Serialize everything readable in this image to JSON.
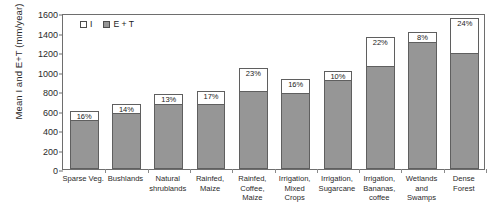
{
  "chart_data": {
    "type": "bar",
    "subtype": "stacked-bar",
    "title": "",
    "xlabel": "",
    "ylabel": "Mean I and E+T (mm/year)",
    "ylim": [
      0,
      1600
    ],
    "ytick_step": 200,
    "yticks": [
      0,
      200,
      400,
      600,
      800,
      1000,
      1200,
      1400,
      1600
    ],
    "ytick_labels": [
      "0",
      "200",
      "400",
      "600",
      "800",
      "1000",
      "1200",
      "1400",
      "1600"
    ],
    "grid": false,
    "legend_position": "top-left-inside",
    "categories": [
      "Sparse Veg.",
      "Bushlands",
      "Natural shrublands",
      "Rainfed, Maize",
      "Rainfed, Coffee, Maize",
      "Irrigation, Mixed Crops",
      "Irrigation, Sugarcane",
      "Irrigation, Bananas, coffee",
      "Wetlands and Swamps",
      "Dense Forest"
    ],
    "category_lines": [
      [
        "Sparse Veg."
      ],
      [
        "Bushlands"
      ],
      [
        "Natural",
        "shrublands"
      ],
      [
        "Rainfed,",
        "Maize"
      ],
      [
        "Rainfed,",
        "Coffee,",
        "Maize"
      ],
      [
        "Irrigation,",
        "Mixed",
        "Crops"
      ],
      [
        "Irrigation,",
        "Sugarcane"
      ],
      [
        "Irrigation,",
        "Bananas,",
        "coffee"
      ],
      [
        "Wetlands",
        "and",
        "Swamps"
      ],
      [
        "Dense",
        "Forest"
      ]
    ],
    "series": [
      {
        "name": "E + T",
        "color": "#969696",
        "values": [
          500,
          575,
          670,
          665,
          800,
          775,
          910,
          1060,
          1300,
          1190
        ]
      },
      {
        "name": "I",
        "color": "#ffffff",
        "values": [
          100,
          95,
          100,
          135,
          240,
          145,
          100,
          290,
          110,
          360
        ]
      }
    ],
    "totals": [
      600,
      670,
      770,
      800,
      1040,
      920,
      1010,
      1350,
      1410,
      1550
    ],
    "annotations": {
      "label_kind": "percent-of-total-for-I",
      "values": [
        "16%",
        "14%",
        "13%",
        "17%",
        "23%",
        "16%",
        "10%",
        "22%",
        "8%",
        "24%"
      ]
    },
    "legend": [
      {
        "label": "I",
        "swatch": "white-square",
        "color": "#ffffff"
      },
      {
        "label": "E + T",
        "swatch": "gray-square",
        "color": "#969696"
      }
    ]
  }
}
